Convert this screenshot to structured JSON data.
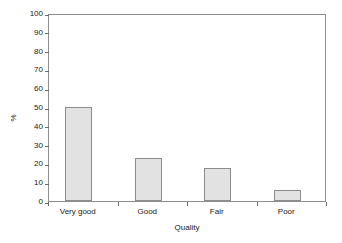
{
  "chart_data": {
    "type": "bar",
    "title": "",
    "subtitle": "",
    "xlabel": "Quality",
    "ylabel": "%",
    "categories": [
      "Very good",
      "Good",
      "Fair",
      "Poor"
    ],
    "values": [
      50,
      23,
      17.5,
      6
    ],
    "series": [
      {
        "name": "%",
        "values": [
          50,
          23,
          17.5,
          6
        ]
      }
    ],
    "ylim": [
      0,
      100
    ],
    "y_ticks": [
      0,
      10,
      20,
      30,
      40,
      50,
      60,
      70,
      80,
      90,
      100
    ],
    "y_tick_labels": [
      "0",
      "10",
      "20",
      "30",
      "40",
      "50",
      "60",
      "70",
      "80",
      "90",
      "100"
    ],
    "x_tick_labels": [
      "Very good",
      "Good",
      "Fair",
      "Poor"
    ],
    "grid": false,
    "legend": false,
    "legend_position": "none",
    "annotations": [],
    "colors": {
      "bar_fill": "#e2e2e2",
      "bar_border": "#8c8c8c",
      "frame": "#8e8e8e",
      "tick": "#6e6e6e",
      "text": "#1a1a1a",
      "background": "#ffffff"
    }
  }
}
